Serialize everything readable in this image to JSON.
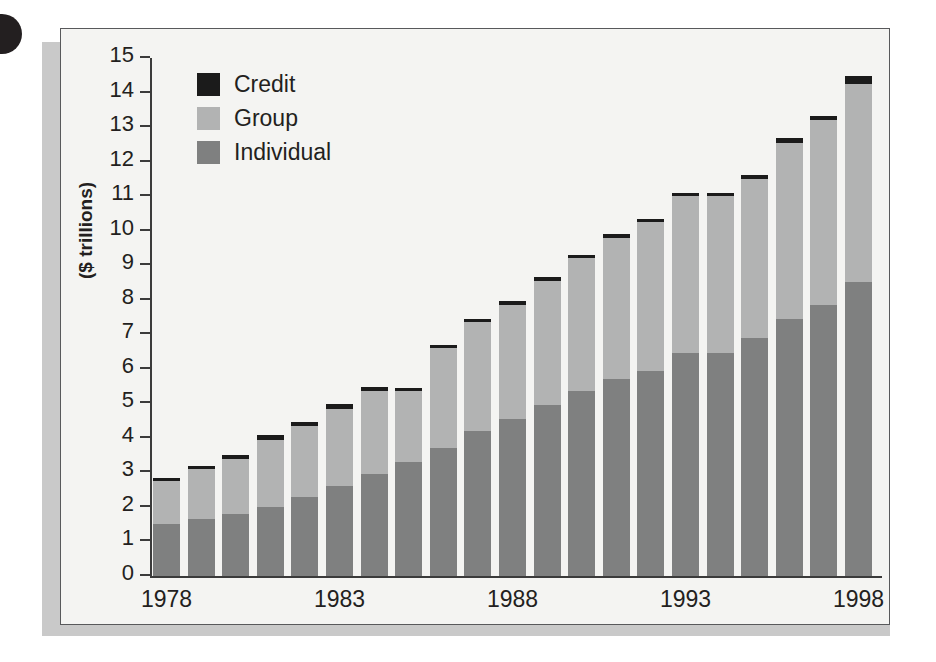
{
  "page": {
    "bullet_icon": "filled-circle-marker"
  },
  "chart_data": {
    "type": "bar",
    "stacked": true,
    "title": "",
    "subtitle": "",
    "xlabel": "",
    "ylabel": "($ trillions)",
    "ylim": [
      0,
      15
    ],
    "ytick_labels": [
      "15",
      "14",
      "13",
      "12",
      "11",
      "10",
      "9",
      "8",
      "7",
      "6",
      "5",
      "4",
      "3",
      "2",
      "1",
      "0"
    ],
    "ytick_values": [
      15,
      14,
      13,
      12,
      11,
      10,
      9,
      8,
      7,
      6,
      5,
      4,
      3,
      2,
      1,
      0
    ],
    "grid": false,
    "legend_position": "upper-left-inside",
    "categories": [
      "1978",
      "1979",
      "1980",
      "1981",
      "1982",
      "1983",
      "1984",
      "1985",
      "1986",
      "1987",
      "1988",
      "1989",
      "1990",
      "1991",
      "1992",
      "1993",
      "1994",
      "1995",
      "1996",
      "1997",
      "1998"
    ],
    "xtick_labels_shown": [
      "1978",
      "1983",
      "1988",
      "1993",
      "1998"
    ],
    "series": [
      {
        "name": "Individual",
        "color": "#7f8080",
        "values": [
          1.5,
          1.65,
          1.8,
          2.0,
          2.3,
          2.6,
          2.95,
          3.3,
          3.7,
          4.2,
          4.55,
          4.95,
          5.35,
          5.7,
          5.95,
          6.45,
          6.45,
          6.9,
          7.45,
          7.85,
          8.5
        ]
      },
      {
        "name": "Group",
        "color": "#b2b3b3",
        "values": [
          1.25,
          1.45,
          1.6,
          1.95,
          2.05,
          2.25,
          2.4,
          2.05,
          2.9,
          3.15,
          3.3,
          3.6,
          3.85,
          4.1,
          4.3,
          4.55,
          4.55,
          4.6,
          5.1,
          5.35,
          5.75
        ]
      },
      {
        "name": "Credit",
        "color": "#1b1b1b",
        "values": [
          0.1,
          0.1,
          0.1,
          0.13,
          0.12,
          0.12,
          0.11,
          0.1,
          0.1,
          0.1,
          0.1,
          0.1,
          0.1,
          0.1,
          0.1,
          0.1,
          0.1,
          0.1,
          0.13,
          0.12,
          0.22
        ]
      }
    ],
    "totals": [
      2.85,
      3.2,
      3.5,
      4.08,
      4.47,
      4.97,
      5.46,
      5.45,
      6.7,
      7.45,
      7.95,
      8.65,
      9.3,
      9.9,
      10.35,
      11.1,
      11.1,
      11.6,
      12.68,
      13.32,
      14.47
    ]
  },
  "legend": {
    "items": [
      {
        "label": "Credit",
        "swatch": "#1b1b1b"
      },
      {
        "label": "Group",
        "swatch": "#b2b3b3"
      },
      {
        "label": "Individual",
        "swatch": "#7f8080"
      }
    ]
  }
}
